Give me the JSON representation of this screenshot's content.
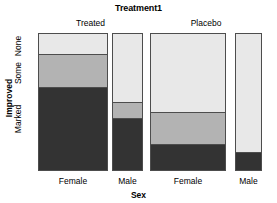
{
  "title": "Treatment1",
  "axes": {
    "x_title": "Sex",
    "y_title": "Improved",
    "y_ticks": [
      "None",
      "Some",
      "Marked"
    ],
    "x_ticks": [
      "Female",
      "Male",
      "Female",
      "Male"
    ]
  },
  "strips": [
    {
      "label": "Treated"
    },
    {
      "label": "Placebo"
    }
  ],
  "colors": {
    "none": "#e8e8e8",
    "some": "#b3b3b3",
    "marked": "#333333",
    "border": "#4d4d4d",
    "background": "#ffffff",
    "text": "#000000"
  },
  "chart_data": {
    "type": "bar",
    "subtype": "mosaic-spine-plot",
    "title": "Treatment1",
    "xlabel": "Sex",
    "ylabel": "Improved",
    "grid": false,
    "legend": "none",
    "ylim": [
      0,
      100
    ],
    "y_tick_labels": [
      "None",
      "Some",
      "Marked"
    ],
    "categories": [
      {
        "treatment": "Treated",
        "sex": "Female",
        "width_frac": 0.313
      },
      {
        "treatment": "Treated",
        "sex": "Male",
        "width_frac": 0.138
      },
      {
        "treatment": "Placebo",
        "sex": "Female",
        "width_frac": 0.339
      },
      {
        "treatment": "Placebo",
        "sex": "Male",
        "width_frac": 0.121
      }
    ],
    "series": [
      {
        "name": "None",
        "values": [
          15,
          50,
          57,
          86
        ]
      },
      {
        "name": "Some",
        "values": [
          24,
          12,
          23,
          0
        ]
      },
      {
        "name": "Marked",
        "values": [
          61,
          38,
          20,
          14
        ]
      }
    ],
    "stack_order_top_to_bottom": [
      "None",
      "Some",
      "Marked"
    ],
    "units": "percent of column"
  },
  "bars": [
    {
      "name": "treated-female",
      "left": 38,
      "width": 70,
      "segments": [
        {
          "label": "None",
          "top": 33,
          "height": 21,
          "color": "#e8e8e8"
        },
        {
          "label": "Some",
          "top": 54,
          "height": 33,
          "color": "#b3b3b3"
        },
        {
          "label": "Marked",
          "top": 87,
          "height": 84,
          "color": "#333333"
        }
      ]
    },
    {
      "name": "treated-male",
      "left": 112,
      "width": 31,
      "segments": [
        {
          "label": "None",
          "top": 33,
          "height": 69,
          "color": "#e8e8e8"
        },
        {
          "label": "Some",
          "top": 102,
          "height": 16,
          "color": "#b3b3b3"
        },
        {
          "label": "Marked",
          "top": 118,
          "height": 53,
          "color": "#333333"
        }
      ]
    },
    {
      "name": "placebo-female",
      "left": 150,
      "width": 76,
      "segments": [
        {
          "label": "None",
          "top": 33,
          "height": 79,
          "color": "#e8e8e8"
        },
        {
          "label": "Some",
          "top": 112,
          "height": 32,
          "color": "#b3b3b3"
        },
        {
          "label": "Marked",
          "top": 144,
          "height": 27,
          "color": "#333333"
        }
      ]
    },
    {
      "name": "placebo-male",
      "left": 235,
      "width": 27,
      "segments": [
        {
          "label": "None",
          "top": 33,
          "height": 119,
          "color": "#e8e8e8"
        },
        {
          "label": "Marked",
          "top": 152,
          "height": 19,
          "color": "#333333"
        }
      ]
    }
  ],
  "layout": {
    "plot_top": 33,
    "plot_bottom": 171,
    "strip_positions": [
      {
        "left": 38,
        "width": 105
      },
      {
        "left": 150,
        "width": 112
      }
    ],
    "xtick_positions": [
      {
        "left": 38,
        "width": 70
      },
      {
        "left": 108,
        "width": 39
      },
      {
        "left": 150,
        "width": 76
      },
      {
        "left": 230,
        "width": 37
      }
    ],
    "ytick_positions": [
      {
        "top": 36,
        "height": 20
      },
      {
        "top": 56,
        "height": 34
      },
      {
        "top": 92,
        "height": 54
      }
    ]
  }
}
